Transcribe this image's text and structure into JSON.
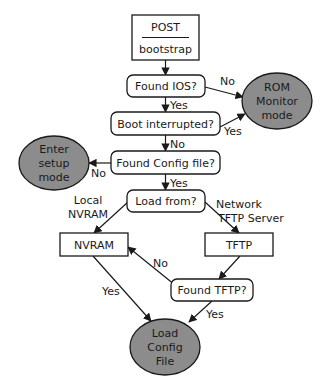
{
  "diagram": {
    "type": "flowchart",
    "colors": {
      "terminal_fill": "#8c8c8c",
      "stroke": "#1a1a1a",
      "background": "#ffffff"
    },
    "nodes": [
      {
        "id": "post",
        "shape": "rect-split",
        "lines": [
          "POST",
          "bootstrap"
        ],
        "x": 132,
        "y": 15,
        "w": 67,
        "h": 45
      },
      {
        "id": "found_ios",
        "shape": "rounded-rect",
        "lines": [
          "Found IOS?"
        ],
        "x": 127,
        "y": 75,
        "w": 78,
        "h": 22
      },
      {
        "id": "rom_monitor",
        "shape": "ellipse",
        "lines": [
          "ROM",
          "Monitor",
          "mode"
        ],
        "cx": 277,
        "cy": 101,
        "rx": 35,
        "ry": 28
      },
      {
        "id": "boot_interrupted",
        "shape": "rounded-rect",
        "lines": [
          "Boot interrupted?"
        ],
        "x": 111,
        "y": 112,
        "w": 109,
        "h": 23
      },
      {
        "id": "enter_setup",
        "shape": "ellipse",
        "lines": [
          "Enter",
          "setup",
          "mode"
        ],
        "cx": 54,
        "cy": 163,
        "rx": 35,
        "ry": 27
      },
      {
        "id": "found_config",
        "shape": "rounded-rect",
        "lines": [
          "Found Config file?"
        ],
        "x": 111,
        "y": 151,
        "w": 109,
        "h": 23
      },
      {
        "id": "load_from",
        "shape": "rounded-rect",
        "lines": [
          "Load from?"
        ],
        "x": 127,
        "y": 190,
        "w": 78,
        "h": 22
      },
      {
        "id": "nvram",
        "shape": "rect",
        "lines": [
          "NVRAM"
        ],
        "x": 60,
        "y": 233,
        "w": 68,
        "h": 23
      },
      {
        "id": "tftp",
        "shape": "rect",
        "lines": [
          "TFTP"
        ],
        "x": 205,
        "y": 233,
        "w": 68,
        "h": 23
      },
      {
        "id": "found_tftp",
        "shape": "rounded-rect",
        "lines": [
          "Found TFTP?"
        ],
        "x": 171,
        "y": 279,
        "w": 82,
        "h": 22
      },
      {
        "id": "load_config",
        "shape": "ellipse",
        "lines": [
          "Load",
          "Config",
          "File"
        ],
        "cx": 165,
        "cy": 347,
        "rx": 35,
        "ry": 28
      }
    ],
    "edges": [
      {
        "from": "post",
        "to": "found_ios",
        "label": "",
        "points": [
          [
            165.5,
            60
          ],
          [
            165.5,
            75
          ]
        ]
      },
      {
        "from": "found_ios",
        "to": "rom_monitor",
        "label": "No",
        "points": [
          [
            205,
            87
          ],
          [
            243,
            97
          ]
        ],
        "label_pos": [
          220,
          85
        ]
      },
      {
        "from": "found_ios",
        "to": "boot_interrupted",
        "label": "Yes",
        "points": [
          [
            165.5,
            97
          ],
          [
            165.5,
            112
          ]
        ],
        "label_pos": [
          170,
          109
        ]
      },
      {
        "from": "boot_interrupted",
        "to": "rom_monitor",
        "label": "Yes",
        "points": [
          [
            220,
            127
          ],
          [
            245,
            114
          ]
        ],
        "label_pos": [
          224,
          135
        ]
      },
      {
        "from": "boot_interrupted",
        "to": "found_config",
        "label": "No",
        "points": [
          [
            165.5,
            135
          ],
          [
            165.5,
            151
          ]
        ],
        "label_pos": [
          170,
          148
        ]
      },
      {
        "from": "found_config",
        "to": "enter_setup",
        "label": "No",
        "points": [
          [
            111,
            163
          ],
          [
            89,
            163
          ]
        ],
        "label_pos": [
          91,
          177
        ]
      },
      {
        "from": "found_config",
        "to": "load_from",
        "label": "Yes",
        "points": [
          [
            165.5,
            174
          ],
          [
            165.5,
            190
          ]
        ],
        "label_pos": [
          170,
          187
        ]
      },
      {
        "from": "load_from",
        "to": "nvram",
        "label": "Local NVRAM",
        "points": [
          [
            128,
            202
          ],
          [
            94,
            233
          ]
        ],
        "label_lines": [
          "Local",
          "NVRAM"
        ],
        "label_pos": [
          88,
          204
        ]
      },
      {
        "from": "load_from",
        "to": "tftp",
        "label": "Network / TFTP Server",
        "points": [
          [
            205,
            202
          ],
          [
            239,
            233
          ]
        ],
        "label_lines": [
          "Network",
          "TFTP Server"
        ],
        "label_pos": [
          216,
          208
        ]
      },
      {
        "from": "tftp",
        "to": "found_tftp",
        "label": "",
        "points": [
          [
            240,
            256
          ],
          [
            219,
            279
          ]
        ]
      },
      {
        "from": "found_tftp",
        "to": "nvram",
        "label": "No",
        "points": [
          [
            175,
            285
          ],
          [
            128,
            247
          ]
        ],
        "label_pos": [
          153,
          267
        ]
      },
      {
        "from": "nvram",
        "to": "load_config",
        "label": "Yes",
        "points": [
          [
            93,
            256
          ],
          [
            151,
            321
          ]
        ],
        "label_pos": [
          102,
          295
        ]
      },
      {
        "from": "found_tftp",
        "to": "load_config",
        "label": "Yes",
        "points": [
          [
            212,
            301
          ],
          [
            189,
            322
          ]
        ],
        "label_pos": [
          206,
          318
        ]
      }
    ]
  }
}
